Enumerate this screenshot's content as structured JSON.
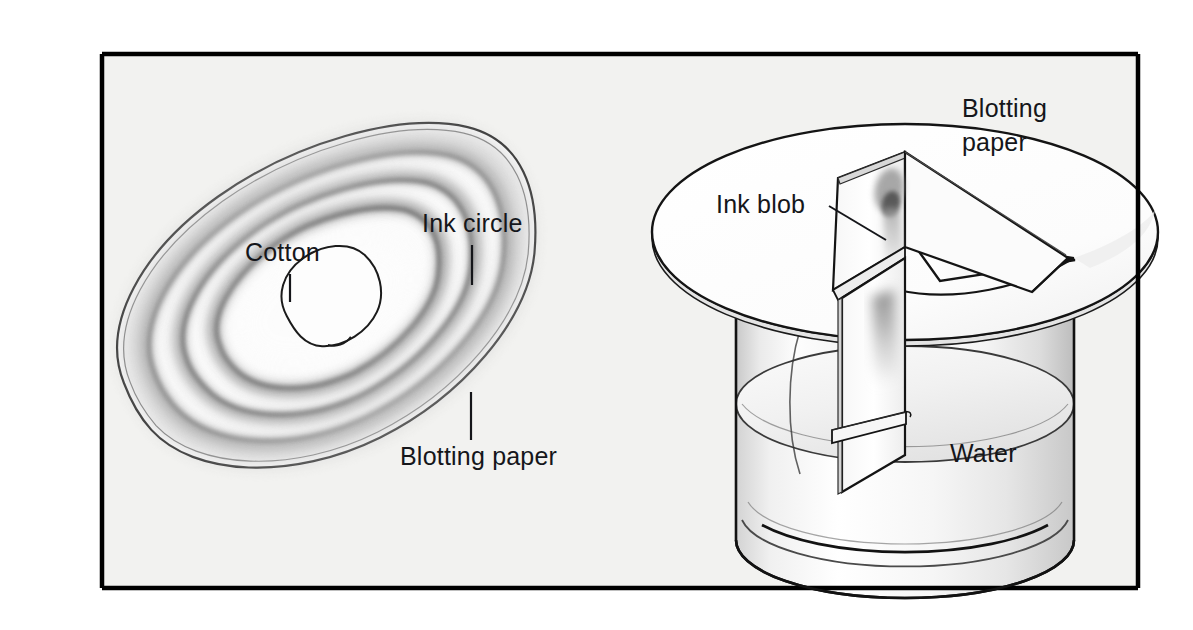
{
  "figure": {
    "kind": "science-diagram",
    "background_color": "#ffffff",
    "panel_background_color": "#f2f2f0",
    "frame_color": "#000000",
    "ink_color": "#15161a"
  },
  "frame": {
    "x": 102,
    "y": 54,
    "width": 1036,
    "height": 534
  },
  "left_panel": {
    "name": "radial-chromatogram",
    "labels": {
      "cotton": "Cotton",
      "ink_circle": "Ink circle",
      "blotting_paper": "Blotting paper"
    },
    "rings": [
      {
        "name": "outer-halo",
        "shade": "#d8d8d8"
      },
      {
        "name": "ring-1",
        "shade": "#a9a9a9"
      },
      {
        "name": "ring-2",
        "shade": "#9a9a9a"
      },
      {
        "name": "ring-3",
        "shade": "#8f8f8f"
      },
      {
        "name": "inner-clear",
        "shade": "#fbfbfb"
      }
    ]
  },
  "right_panel": {
    "name": "beaker-setup",
    "labels": {
      "blotting_paper_line1": "Blotting",
      "blotting_paper_line2": "paper",
      "ink_blob": "Ink blob",
      "water": "Water"
    },
    "parts": [
      {
        "name": "beaker",
        "description": "clear cylindrical glass vessel"
      },
      {
        "name": "lid",
        "description": "circular blotting paper lid with wedge cut"
      },
      {
        "name": "paper-strip",
        "description": "strip folded down into the water"
      },
      {
        "name": "crossbar",
        "description": "horizontal support bar"
      },
      {
        "name": "water-body",
        "description": "water filling lower part of beaker"
      }
    ]
  }
}
